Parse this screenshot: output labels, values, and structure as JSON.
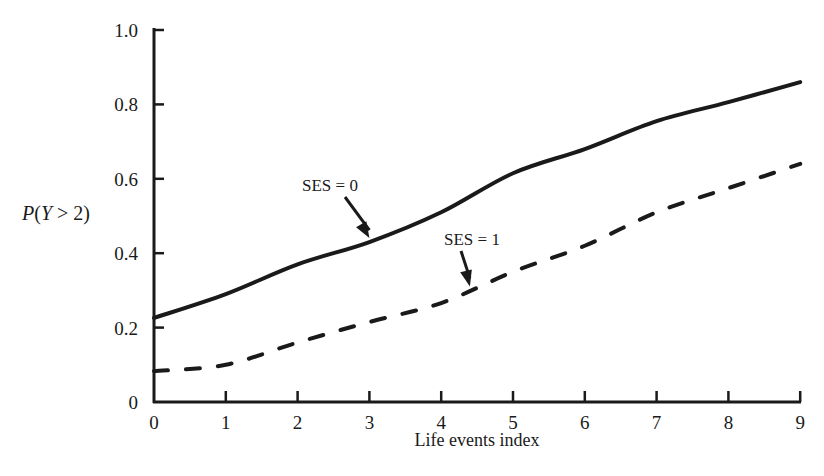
{
  "chart_data": {
    "type": "line",
    "title": "",
    "xlabel": "Life events index",
    "ylabel": "P(Y > 2)",
    "ylabel_parts": {
      "p": "P",
      "open": "(",
      "var": "Y",
      "rest": " > 2)"
    },
    "xlim": [
      0,
      9
    ],
    "ylim": [
      0,
      1.0
    ],
    "grid": false,
    "legend": "none (inline annotations with arrows)",
    "x_ticks": [
      "0",
      "1",
      "2",
      "3",
      "4",
      "5",
      "6",
      "7",
      "8",
      "9"
    ],
    "y_ticks": [
      "0",
      "0.2",
      "0.4",
      "0.6",
      "0.8",
      "1.0"
    ],
    "x": [
      0,
      1,
      2,
      3,
      4,
      5,
      6,
      7,
      8,
      9
    ],
    "series": [
      {
        "name": "SES = 0",
        "style": "solid",
        "color": "#1a1a1a",
        "values": [
          0.226,
          0.29,
          0.37,
          0.43,
          0.51,
          0.615,
          0.68,
          0.755,
          0.806,
          0.86
        ]
      },
      {
        "name": "SES = 1",
        "style": "dashed",
        "color": "#1a1a1a",
        "values": [
          0.083,
          0.1,
          0.16,
          0.215,
          0.266,
          0.35,
          0.42,
          0.51,
          0.575,
          0.64
        ]
      }
    ],
    "annotations": [
      {
        "text": "SES = 0",
        "arrow_to": {
          "x": 3.0,
          "y": 0.43
        }
      },
      {
        "text": "SES = 1",
        "arrow_to": {
          "x": 4.4,
          "y": 0.3
        }
      }
    ]
  }
}
